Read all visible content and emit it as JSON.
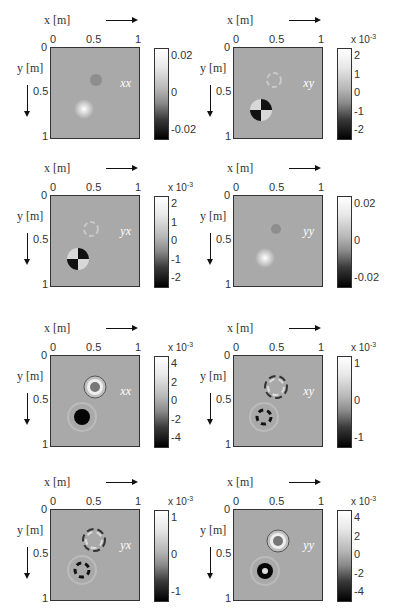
{
  "figure": {
    "x_axis_label": "x [m]",
    "y_axis_label": "y [m]",
    "x_ticks": [
      "0",
      "0.5",
      "1"
    ],
    "y_ticks": [
      "0",
      "0.5",
      "1"
    ]
  },
  "panels": [
    {
      "component": "xx",
      "colorbar_exponent": "",
      "colorbar_ticks": [
        "0.02",
        "0",
        "-0.02"
      ],
      "glyph": "horizontal-bars"
    },
    {
      "component": "xy",
      "colorbar_exponent": "x 10",
      "colorbar_exp_power": "-3",
      "colorbar_ticks": [
        "2",
        "1",
        "0",
        "-1",
        "-2"
      ],
      "glyph": "cross-black-horizontal"
    },
    {
      "component": "yx",
      "colorbar_exponent": "x 10",
      "colorbar_exp_power": "-3",
      "colorbar_ticks": [
        "2",
        "1",
        "0",
        "-1",
        "-2"
      ],
      "glyph": "cross-white-horizontal"
    },
    {
      "component": "yy",
      "colorbar_exponent": "",
      "colorbar_ticks": [
        "0.02",
        "0",
        "-0.02"
      ],
      "glyph": "vertical-bars"
    },
    {
      "component": "xx",
      "colorbar_exponent": "x 10",
      "colorbar_exp_power": "-3",
      "colorbar_ticks": [
        "4",
        "2",
        "0",
        "-2",
        "-4"
      ],
      "glyph": "horizontal-bars"
    },
    {
      "component": "xy",
      "colorbar_exponent": "x 10",
      "colorbar_exp_power": "-3",
      "colorbar_ticks": [
        "1",
        "0",
        "-1"
      ],
      "glyph": "cross-black-horizontal"
    },
    {
      "component": "yx",
      "colorbar_exponent": "x 10",
      "colorbar_exp_power": "-3",
      "colorbar_ticks": [
        "1",
        "0",
        "-1"
      ],
      "glyph": "cross-white-horizontal"
    },
    {
      "component": "yy",
      "colorbar_exponent": "x 10",
      "colorbar_exp_power": "-3",
      "colorbar_ticks": [
        "4",
        "2",
        "0",
        "-2",
        "-4"
      ],
      "glyph": "vertical-bars"
    }
  ],
  "chart_data": [
    {
      "type": "heatmap",
      "title": "xx (row 1)",
      "xlabel": "x [m]",
      "ylabel": "y [m]",
      "xlim": [
        0,
        1
      ],
      "ylim": [
        1,
        0
      ],
      "clim": [
        -0.03,
        0.03
      ],
      "colorbar_ticks": [
        0.02,
        0,
        -0.02
      ],
      "features": [
        {
          "x": 0.5,
          "y": 0.35,
          "kind": "weak dark spot"
        },
        {
          "x": 0.37,
          "y": 0.68,
          "kind": "bright spot"
        }
      ]
    },
    {
      "type": "heatmap",
      "title": "xy (row 1)",
      "xlabel": "x [m]",
      "ylabel": "y [m]",
      "xlim": [
        0,
        1
      ],
      "ylim": [
        1,
        0
      ],
      "clim": [
        -0.002,
        0.002
      ],
      "colorbar_scale": "x 10^-3",
      "colorbar_ticks": [
        2,
        1,
        0,
        -1,
        -2
      ],
      "features": [
        {
          "x": 0.45,
          "y": 0.35,
          "kind": "faint quadrupole ring"
        },
        {
          "x": 0.3,
          "y": 0.68,
          "kind": "quadrupole"
        }
      ]
    },
    {
      "type": "heatmap",
      "title": "yx (row 2)",
      "xlabel": "x [m]",
      "ylabel": "y [m]",
      "xlim": [
        0,
        1
      ],
      "ylim": [
        1,
        0
      ],
      "clim": [
        -0.002,
        0.002
      ],
      "colorbar_scale": "x 10^-3",
      "colorbar_ticks": [
        2,
        1,
        0,
        -1,
        -2
      ],
      "features": [
        {
          "x": 0.45,
          "y": 0.35,
          "kind": "faint quadrupole ring"
        },
        {
          "x": 0.3,
          "y": 0.7,
          "kind": "quadrupole"
        }
      ]
    },
    {
      "type": "heatmap",
      "title": "yy (row 2)",
      "xlabel": "x [m]",
      "ylabel": "y [m]",
      "xlim": [
        0,
        1
      ],
      "ylim": [
        1,
        0
      ],
      "clim": [
        -0.03,
        0.03
      ],
      "colorbar_ticks": [
        0.02,
        0,
        -0.02
      ],
      "features": [
        {
          "x": 0.48,
          "y": 0.37,
          "kind": "weak dark spot"
        },
        {
          "x": 0.35,
          "y": 0.7,
          "kind": "bright spot"
        }
      ]
    },
    {
      "type": "heatmap",
      "title": "xx (row 3)",
      "xlabel": "x [m]",
      "ylabel": "y [m]",
      "xlim": [
        0,
        1
      ],
      "ylim": [
        1,
        0
      ],
      "clim": [
        -0.005,
        0.005
      ],
      "colorbar_scale": "x 10^-3",
      "colorbar_ticks": [
        4,
        2,
        0,
        -2,
        -4
      ],
      "features": [
        {
          "x": 0.5,
          "y": 0.35,
          "kind": "bright ring"
        },
        {
          "x": 0.35,
          "y": 0.68,
          "kind": "dark ring"
        }
      ]
    },
    {
      "type": "heatmap",
      "title": "xy (row 3)",
      "xlabel": "x [m]",
      "ylabel": "y [m]",
      "xlim": [
        0,
        1
      ],
      "ylim": [
        1,
        0
      ],
      "clim": [
        -0.0015,
        0.0015
      ],
      "colorbar_scale": "x 10^-3",
      "colorbar_ticks": [
        1,
        0,
        -1
      ],
      "features": [
        {
          "x": 0.5,
          "y": 0.37,
          "kind": "quadrupole ring"
        },
        {
          "x": 0.37,
          "y": 0.7,
          "kind": "quadrupole ring"
        }
      ]
    },
    {
      "type": "heatmap",
      "title": "yx (row 4)",
      "xlabel": "x [m]",
      "ylabel": "y [m]",
      "xlim": [
        0,
        1
      ],
      "ylim": [
        1,
        0
      ],
      "clim": [
        -0.0015,
        0.0015
      ],
      "colorbar_scale": "x 10^-3",
      "colorbar_ticks": [
        1,
        0,
        -1
      ],
      "features": [
        {
          "x": 0.5,
          "y": 0.35,
          "kind": "quadrupole ring"
        },
        {
          "x": 0.37,
          "y": 0.68,
          "kind": "quadrupole ring"
        }
      ]
    },
    {
      "type": "heatmap",
      "title": "yy (row 4)",
      "xlabel": "x [m]",
      "ylabel": "y [m]",
      "xlim": [
        0,
        1
      ],
      "ylim": [
        1,
        0
      ],
      "clim": [
        -0.005,
        0.005
      ],
      "colorbar_scale": "x 10^-3",
      "colorbar_ticks": [
        4,
        2,
        0,
        -2,
        -4
      ],
      "features": [
        {
          "x": 0.5,
          "y": 0.35,
          "kind": "bright ring"
        },
        {
          "x": 0.35,
          "y": 0.68,
          "kind": "dark ring"
        }
      ]
    }
  ]
}
